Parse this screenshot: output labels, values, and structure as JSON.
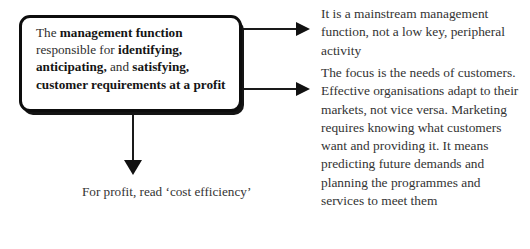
{
  "diagram": {
    "main_box": {
      "segments": [
        {
          "text": "The ",
          "bold": false
        },
        {
          "text": "management function",
          "bold": true
        },
        {
          "text": " responsible for ",
          "bold": false
        },
        {
          "text": "identifying,",
          "bold": true
        },
        {
          "text": " ",
          "bold": false
        },
        {
          "text": "anticipating,",
          "bold": true
        },
        {
          "text": " and ",
          "bold": false
        },
        {
          "text": "satisfying, customer requirements at a profit",
          "bold": true
        }
      ],
      "plain_text": "The management function responsible for identifying, anticipating, and satisfying, customer requirements at a profit"
    },
    "caption": "For profit, read ‘cost efficiency’",
    "callouts": [
      "It is a mainstream management function, not a low key, peripheral activity",
      "The focus is the needs of customers. Effective organisations adapt to their markets, not vice versa. Marketing requires knowing what customers want and providing it. It means predicting future demands and planning the programmes and services to meet them"
    ],
    "arrows": [
      {
        "name": "arrow-to-callout-1",
        "direction": "right"
      },
      {
        "name": "arrow-to-callout-2",
        "direction": "right"
      },
      {
        "name": "arrow-to-caption",
        "direction": "down"
      }
    ],
    "colors": {
      "background": "#ffffff",
      "box_border": "#0d0d0d",
      "box_shadow": "#141414",
      "arrow": "#111111",
      "text": "#333333",
      "bold_text": "#151515"
    }
  }
}
